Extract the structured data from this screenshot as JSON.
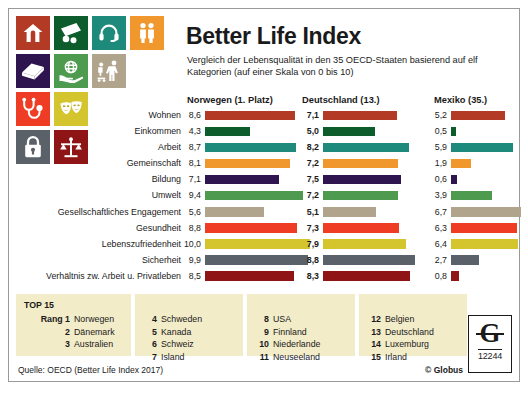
{
  "header": {
    "title": "Better Life Index",
    "subtitle": "Vergleich der Lebensqualität in den 35 OECD-Staaten basierend auf elf Kategorien (auf einer Skala von 0 bis 10)"
  },
  "icons": [
    {
      "name": "house-icon",
      "color": "#b33a24",
      "label": "Wohnen"
    },
    {
      "name": "money-icon",
      "color": "#0d5c2c",
      "label": "Einkommen"
    },
    {
      "name": "headset-icon",
      "color": "#1e8a7c",
      "label": "Arbeit"
    },
    {
      "name": "two-people-icon",
      "color": "#f0982d",
      "label": "Gemeinschaft"
    },
    {
      "name": "book-icon",
      "color": "#2e1550",
      "label": "Bildung"
    },
    {
      "name": "globe-in-hand-icon",
      "color": "#4e9a4e",
      "label": "Umwelt"
    },
    {
      "name": "volunteering-icon",
      "color": "#b0a48d",
      "label": "Gesellschaftliches Engagement"
    },
    {
      "name": "stethoscope-icon",
      "color": "#ee3d24",
      "label": "Gesundheit"
    },
    {
      "name": "theater-masks-icon",
      "color": "#d4c42e",
      "label": "Lebenszufriedenheit"
    },
    {
      "name": "padlock-icon",
      "color": "#5a6168",
      "label": "Sicherheit"
    },
    {
      "name": "scales-icon",
      "color": "#8e1416",
      "label": "Verhältnis zw. Arbeit u. Privatleben"
    }
  ],
  "chart_data": {
    "type": "bar",
    "title": "Better Life Index",
    "subtitle": "Vergleich der Lebensqualität in den 35 OECD-Staaten basierend auf elf Kategorien (auf einer Skala von 0 bis 10)",
    "xlabel": "",
    "ylabel": "",
    "xlim": [
      0,
      10
    ],
    "grid": false,
    "legend_position": "top",
    "orientation": "horizontal",
    "scale_note": "Skala von 0 bis 10",
    "categories": [
      "Wohnen",
      "Einkommen",
      "Arbeit",
      "Gemeinschaft",
      "Bildung",
      "Umwelt",
      "Gesellschaftliches Engagement",
      "Gesundheit",
      "Lebenszufriedenheit",
      "Sicherheit",
      "Verhältnis zw. Arbeit u. Privatleben"
    ],
    "category_colors": [
      "#b33a24",
      "#0d5c2c",
      "#1e8a7c",
      "#f0982d",
      "#2e1550",
      "#4e9a4e",
      "#b0a48d",
      "#ee3d24",
      "#d4c42e",
      "#5a6168",
      "#8e1416"
    ],
    "series": [
      {
        "name": "Norwegen (1. Platz)",
        "values": [
          8.6,
          4.3,
          8.7,
          8.1,
          7.1,
          9.4,
          5.6,
          8.8,
          10.0,
          9.9,
          8.5
        ],
        "labels": [
          "8,6",
          "4,3",
          "8,7",
          "8,1",
          "7,1",
          "9,4",
          "5,6",
          "8,8",
          "10,0",
          "9,9",
          "8,5"
        ]
      },
      {
        "name": "Deutschland (13.)",
        "values": [
          7.1,
          5.0,
          8.2,
          7.2,
          7.5,
          7.2,
          5.1,
          7.3,
          7.9,
          8.8,
          8.3
        ],
        "labels": [
          "7,1",
          "5,0",
          "8,2",
          "7,2",
          "7,5",
          "7,2",
          "5,1",
          "7,3",
          "7,9",
          "8,8",
          "8,3"
        ]
      },
      {
        "name": "Mexiko (35.)",
        "values": [
          5.2,
          0.5,
          5.9,
          1.9,
          0.6,
          3.9,
          6.7,
          6.3,
          6.4,
          2.7,
          0.8
        ],
        "labels": [
          "5,2",
          "0,5",
          "5,9",
          "1,9",
          "0,6",
          "3,9",
          "6,7",
          "6,3",
          "6,4",
          "2,7",
          "0,8"
        ]
      }
    ]
  },
  "top15": {
    "heading": "TOP 15",
    "rank_label": "Rang",
    "columns": [
      [
        {
          "rank": "1",
          "country": "Norwegen"
        },
        {
          "rank": "2",
          "country": "Dänemark"
        },
        {
          "rank": "3",
          "country": "Australien"
        }
      ],
      [
        {
          "rank": "4",
          "country": "Schweden"
        },
        {
          "rank": "5",
          "country": "Kanada"
        },
        {
          "rank": "6",
          "country": "Schweiz"
        },
        {
          "rank": "7",
          "country": "Island"
        }
      ],
      [
        {
          "rank": "8",
          "country": "USA"
        },
        {
          "rank": "9",
          "country": "Finnland"
        },
        {
          "rank": "10",
          "country": "Niederlande"
        },
        {
          "rank": "11",
          "country": "Neuseeland"
        }
      ],
      [
        {
          "rank": "12",
          "country": "Belgien"
        },
        {
          "rank": "13",
          "country": "Deutschland"
        },
        {
          "rank": "14",
          "country": "Luxemburg"
        },
        {
          "rank": "15",
          "country": "Irland"
        }
      ]
    ]
  },
  "footer": {
    "source": "Quelle: OECD (Better Life Index 2017)",
    "copyright": "© Globus",
    "logo_letter": "G",
    "logo_number": "12244"
  }
}
